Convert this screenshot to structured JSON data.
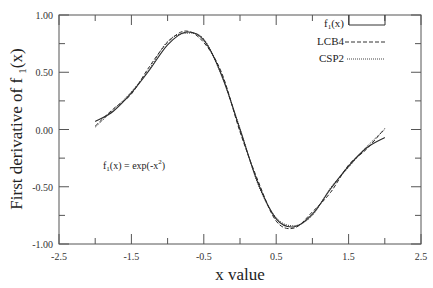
{
  "chart_data": {
    "type": "line",
    "title": "",
    "xlabel": "x value",
    "ylabel": "First derivative of f 1(x)",
    "xlim": [
      -2.5,
      2.5
    ],
    "ylim": [
      -1.0,
      1.0
    ],
    "grid": false,
    "legend_position": "top-right",
    "x_ticks": [
      "-2.5",
      "-1.5",
      "-0.5",
      "0.5",
      "1.5",
      "2.5"
    ],
    "y_ticks": [
      "1.00",
      "0.50",
      "0.00",
      "-0.50",
      "-1.00"
    ],
    "annotation": "f1(x) = exp(-x2)",
    "x": [
      -2.0,
      -1.75,
      -1.5,
      -1.25,
      -1.0,
      -0.75,
      -0.5,
      -0.25,
      0.0,
      0.25,
      0.5,
      0.75,
      1.0,
      1.25,
      1.5,
      1.75,
      2.0
    ],
    "series": [
      {
        "name": "f1(x)",
        "style": "solid",
        "values": [
          0.07,
          0.16,
          0.32,
          0.52,
          0.74,
          0.85,
          0.78,
          0.47,
          0.0,
          -0.47,
          -0.78,
          -0.85,
          -0.74,
          -0.52,
          -0.32,
          -0.16,
          -0.07
        ]
      },
      {
        "name": "LCB4",
        "style": "dashed",
        "values": [
          0.03,
          0.18,
          0.31,
          0.55,
          0.76,
          0.86,
          0.76,
          0.49,
          -0.02,
          -0.45,
          -0.8,
          -0.86,
          -0.72,
          -0.55,
          -0.31,
          -0.17,
          0.01
        ]
      },
      {
        "name": "CSP2",
        "style": "dotted",
        "values": [
          0.02,
          0.17,
          0.33,
          0.53,
          0.77,
          0.84,
          0.79,
          0.46,
          0.01,
          -0.48,
          -0.77,
          -0.84,
          -0.75,
          -0.51,
          -0.33,
          -0.15,
          0.0
        ]
      }
    ]
  },
  "legend": {
    "items": [
      {
        "label": "f1(x)",
        "main": "f",
        "sub": "1",
        "tail": "(x)",
        "style": "solid"
      },
      {
        "label": "LCB4",
        "main": "LCB4",
        "style": "dashed"
      },
      {
        "label": "CSP2",
        "main": "CSP2",
        "style": "dotted"
      }
    ]
  },
  "axes": {
    "ylabel_main": "First derivative of f ",
    "ylabel_sub": "1",
    "ylabel_tail": "(x)",
    "xlabel": "x value"
  },
  "annotation": {
    "pre": "f",
    "sub": "1",
    "mid": "(x) = exp(-x",
    "sup": "2",
    "post": ")"
  }
}
